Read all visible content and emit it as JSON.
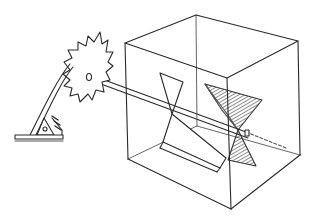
{
  "illustration": {
    "caption": "",
    "subject": "sketch of a saw blade on a bracket with an axle passing through a transparent cube containing twisted vanes",
    "colors": {
      "ink": "#2a2a2a",
      "shade": "#6a6a6a",
      "paper": "#ffffff"
    }
  }
}
